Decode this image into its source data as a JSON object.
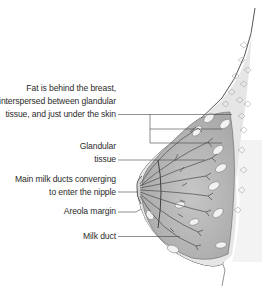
{
  "diagram": {
    "labels": [
      {
        "id": "fat",
        "lines": [
          "Fat is behind the breast,",
          "interspersed between glandular",
          "tissue, and just under the skin"
        ]
      },
      {
        "id": "glandular",
        "lines": [
          "Glandular",
          "tissue"
        ]
      },
      {
        "id": "main-ducts",
        "lines": [
          "Main milk ducts converging",
          "to enter the nipple"
        ]
      },
      {
        "id": "areola",
        "lines": [
          "Areola margin"
        ]
      },
      {
        "id": "milk-duct",
        "lines": [
          "Milk duct"
        ]
      }
    ],
    "colors": {
      "background": "#ffffff",
      "text": "#2b2b2b",
      "outline": "#555555",
      "tissue_fill": "#b9b9b9",
      "fat_fill": "#e4e4e4",
      "lobule_fill": "#f2f2f2",
      "duct_stroke": "#4a4a4a"
    }
  }
}
